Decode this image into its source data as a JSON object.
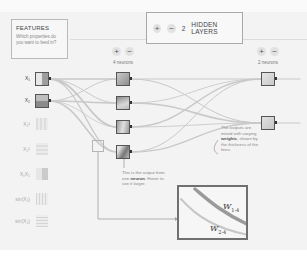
{
  "features_panel": {
    "title": "FEATURES",
    "subtitle": "Which properties do you want to feed in?",
    "items": [
      {
        "label": "X₁",
        "enabled": true,
        "icon": "feature-x1-heatmap"
      },
      {
        "label": "X₂",
        "enabled": true,
        "icon": "feature-x2-heatmap"
      },
      {
        "label": "X₁²",
        "enabled": false,
        "icon": "feature-x1-squared-heatmap"
      },
      {
        "label": "X₂²",
        "enabled": false,
        "icon": "feature-x2-squared-heatmap"
      },
      {
        "label": "X₁X₂",
        "enabled": false,
        "icon": "feature-x1x2-heatmap"
      },
      {
        "label": "sin(X₁)",
        "enabled": false,
        "icon": "feature-sin-x1-heatmap"
      },
      {
        "label": "sin(X₂)",
        "enabled": false,
        "icon": "feature-sin-x2-heatmap"
      }
    ]
  },
  "hidden_layers_control": {
    "add_label": "+",
    "remove_label": "−",
    "count": "2",
    "label": "HIDDEN LAYERS"
  },
  "layers": [
    {
      "add_label": "+",
      "remove_label": "−",
      "neuron_count_label": "4 neurons",
      "neurons": 4
    },
    {
      "add_label": "+",
      "remove_label": "−",
      "neuron_count_label": "2 neurons",
      "neurons": 2
    }
  ],
  "annotations": {
    "neuron_note_pre": "This is the output from one ",
    "neuron_note_bold": "neuron",
    "neuron_note_post": ". Hover to see it larger.",
    "weights_note_pre": "The outputs are mixed with varying ",
    "weights_note_bold": "weights",
    "weights_note_post": ", shown by the thickness of the lines."
  },
  "zoom_inset": {
    "w1_base": "W",
    "w1_sub": "1-4",
    "w2_base": "W",
    "w2_sub": "2-4"
  },
  "colors": {
    "background": "#f3f3f3",
    "neuron_border": "#555555",
    "wire": "#c8c8c8",
    "zoom_border": "#707070"
  }
}
